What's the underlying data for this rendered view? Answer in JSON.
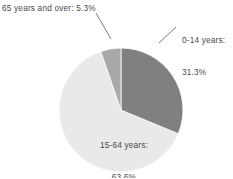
{
  "chart_data": {
    "type": "pie",
    "title": "",
    "subtitle": "",
    "xlabel": "",
    "ylabel": "",
    "legend_position": "none",
    "grid": false,
    "labels_shown_on_slices": true,
    "categories": [
      "0-14 years",
      "15-64 years",
      "65 years and over"
    ],
    "values": [
      31.3,
      63.6,
      5.3
    ],
    "units": "percent",
    "total": 100.2,
    "slices": [
      {
        "name": "0-14 years",
        "value": 31.3,
        "value_text": "31.3%",
        "label_text": "0-14 years:",
        "label_full": "0-14 years: 31.3%",
        "color": "#808080",
        "start_angle_deg": 0,
        "end_angle_deg": 112.68,
        "label_placement": "outside-right",
        "has_leader_line": true
      },
      {
        "name": "15-64 years",
        "value": 63.6,
        "value_text": "63.6%",
        "label_text": "15-64 years:",
        "label_full": "15-64 years: 63.6%",
        "color": "#e9e9e7",
        "start_angle_deg": 112.68,
        "end_angle_deg": 341.64,
        "label_placement": "inside",
        "has_leader_line": false
      },
      {
        "name": "65 years and over",
        "value": 5.3,
        "value_text": "5.3%",
        "label_text": "65 years and over:",
        "label_full": "65 years and over: 5.3%",
        "color": "#a9a9a9",
        "start_angle_deg": 341.64,
        "end_angle_deg": 360,
        "label_placement": "outside-left",
        "has_leader_line": true
      }
    ]
  },
  "labels": {
    "senior": "65 years and over: 5.3%",
    "youth_line1": "0-14 years:",
    "youth_line2": "31.3%",
    "working_line1": "15-64 years:",
    "working_line2": "63.6%"
  },
  "colors": {
    "background": "#ffffff",
    "slice_youth": "#808080",
    "slice_working": "#e9e9e7",
    "slice_senior": "#a9a9a9",
    "slice_border": "#ffffff",
    "label_text": "#4a4a4a",
    "leader_line": "#6b6b6b"
  },
  "geometry": {
    "center_x": 121,
    "center_y": 110,
    "radius": 62
  }
}
